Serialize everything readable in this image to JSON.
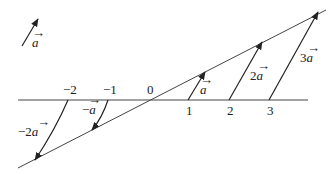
{
  "diagram": {
    "reference_vector": {
      "label": "a",
      "has_arrow_accent": true
    },
    "axis_ticks": [
      {
        "value": "-2",
        "x": 68
      },
      {
        "value": "-1",
        "x": 108
      },
      {
        "value": "0",
        "x": 150
      },
      {
        "value": "1",
        "x": 188
      },
      {
        "value": "2",
        "x": 229
      },
      {
        "value": "3",
        "x": 269
      }
    ],
    "vectors": [
      {
        "coefficient": "-2",
        "label_prefix": "−2",
        "label_var": "a"
      },
      {
        "coefficient": "-1",
        "label_prefix": "−",
        "label_var": "a"
      },
      {
        "coefficient": "1",
        "label_prefix": "",
        "label_var": "a"
      },
      {
        "coefficient": "2",
        "label_prefix": "2",
        "label_var": "a"
      },
      {
        "coefficient": "3",
        "label_prefix": "3",
        "label_var": "a"
      }
    ],
    "tick_labels": [
      "−2",
      "−1",
      "0",
      "1",
      "2",
      "3"
    ],
    "colors": {
      "stroke": "#333333",
      "background": "#ffffff"
    }
  }
}
